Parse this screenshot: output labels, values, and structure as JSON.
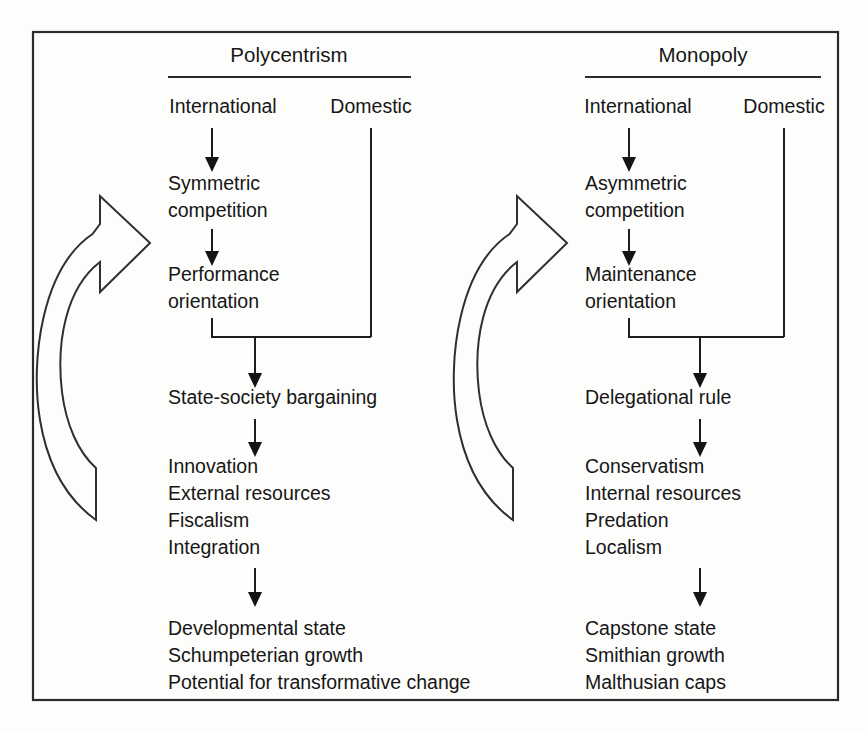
{
  "figure": {
    "background_color": "#fdfdfc",
    "line_color": "#1d1d1d",
    "text_color": "#161616"
  },
  "columns": [
    {
      "id": "polycentrism",
      "title": "Polycentrism",
      "sources": {
        "international": "International",
        "domestic": "Domestic"
      },
      "stages": [
        {
          "id": "competition",
          "lines": [
            "Symmetric",
            "competition"
          ]
        },
        {
          "id": "orientation",
          "lines": [
            "Performance",
            "orientation"
          ]
        },
        {
          "id": "bargaining",
          "lines": [
            "State-society bargaining"
          ]
        },
        {
          "id": "mechanisms",
          "lines": [
            "Innovation",
            "External resources",
            "Fiscalism",
            "Integration"
          ]
        },
        {
          "id": "outcomes",
          "lines": [
            "Developmental state",
            "Schumpeterian growth",
            "Potential for transformative change"
          ]
        }
      ]
    },
    {
      "id": "monopoly",
      "title": "Monopoly",
      "sources": {
        "international": "International",
        "domestic": "Domestic"
      },
      "stages": [
        {
          "id": "competition",
          "lines": [
            "Asymmetric",
            "competition"
          ]
        },
        {
          "id": "orientation",
          "lines": [
            "Maintenance",
            "orientation"
          ]
        },
        {
          "id": "bargaining",
          "lines": [
            "Delegational rule"
          ]
        },
        {
          "id": "mechanisms",
          "lines": [
            "Conservatism",
            "Internal resources",
            "Predation",
            "Localism"
          ]
        },
        {
          "id": "outcomes",
          "lines": [
            "Capstone state",
            "Smithian growth",
            "Malthusian caps"
          ]
        }
      ]
    }
  ]
}
